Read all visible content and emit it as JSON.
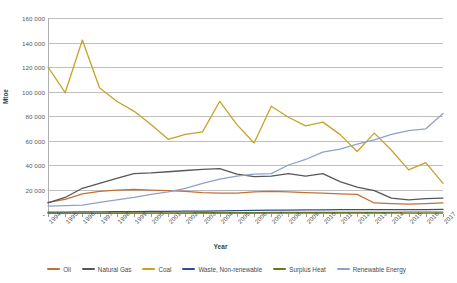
{
  "chart_data": {
    "type": "line",
    "title": "",
    "xlabel": "Year",
    "ylabel": "Mtoe",
    "ylim": [
      0,
      160000
    ],
    "ytick_labels": [
      "-",
      "20 000",
      "40 000",
      "60 000",
      "80 000",
      "100 000",
      "120 000",
      "140 000",
      "160 000"
    ],
    "ytick_values": [
      0,
      20000,
      40000,
      60000,
      80000,
      100000,
      120000,
      140000,
      160000
    ],
    "grid": true,
    "legend_position": "bottom",
    "categories": [
      "1994",
      "1995",
      "1996",
      "1997",
      "1998",
      "1999",
      "2000",
      "2001",
      "2002",
      "2003",
      "2004",
      "2005",
      "2006",
      "2007",
      "2008",
      "2009",
      "2010",
      "2011",
      "2012",
      "2013",
      "2014",
      "2015",
      "2016",
      "2017"
    ],
    "series": [
      {
        "name": "Oil",
        "color": "#c0713a",
        "values": [
          9500,
          12000,
          16500,
          18500,
          19500,
          20000,
          19500,
          19000,
          18500,
          17500,
          17000,
          17000,
          18000,
          18500,
          18000,
          17500,
          17000,
          16500,
          16000,
          9000,
          8500,
          8000,
          8500,
          9000
        ]
      },
      {
        "name": "Natural Gas",
        "color": "#575757",
        "values": [
          9000,
          13500,
          21000,
          25000,
          29000,
          33000,
          33500,
          34500,
          35500,
          36500,
          37000,
          32500,
          30500,
          31000,
          33000,
          31000,
          33000,
          26500,
          22000,
          19000,
          13000,
          11500,
          12500,
          13000
        ]
      },
      {
        "name": "Coal",
        "color": "#c8a227",
        "values": [
          120000,
          99000,
          142000,
          103000,
          92000,
          84000,
          73000,
          61000,
          65000,
          67000,
          92000,
          73000,
          58000,
          88000,
          79000,
          72000,
          75000,
          65000,
          51000,
          66000,
          52000,
          36000,
          42000,
          25000
        ]
      },
      {
        "name": "Waste, Non-renewable",
        "color": "#2c4e96",
        "values": [
          1500,
          1600,
          1700,
          1800,
          1900,
          2000,
          2100,
          2200,
          2300,
          2400,
          2600,
          2800,
          3000,
          3100,
          3200,
          3300,
          3400,
          3500,
          3500,
          3500,
          3600,
          3600,
          3600,
          3700
        ]
      },
      {
        "name": "Surplus Heat",
        "color": "#6b7a19",
        "values": [
          600,
          650,
          700,
          750,
          800,
          850,
          900,
          950,
          1000,
          1050,
          1100,
          1150,
          1200,
          1250,
          1300,
          1300,
          1350,
          1350,
          1400,
          1400,
          1400,
          1450,
          1450,
          1500
        ]
      },
      {
        "name": "Renewable Energy",
        "color": "#8fa1cb",
        "values": [
          6500,
          6800,
          7200,
          9500,
          11500,
          13500,
          16000,
          18000,
          21000,
          25000,
          28500,
          31000,
          32500,
          33000,
          40000,
          44500,
          50500,
          53000,
          57000,
          60500,
          65000,
          68000,
          69500,
          82000
        ]
      }
    ]
  },
  "legend": {
    "items": [
      {
        "label": "Oil"
      },
      {
        "label": "Natural Gas"
      },
      {
        "label": "Coal"
      },
      {
        "label": "Waste, Non-renewable"
      },
      {
        "label": "Surplus Heat"
      },
      {
        "label": "Renewable Energy"
      }
    ]
  }
}
